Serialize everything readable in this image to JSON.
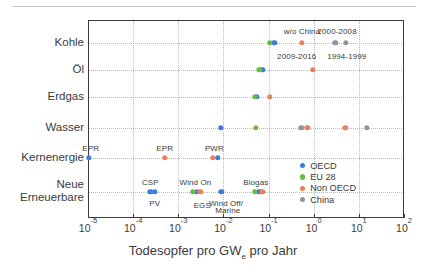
{
  "chart_data": {
    "type": "scatter",
    "title": "",
    "xlabel": "Todesopfer pro GWe pro Jahr",
    "xlabel_main": "Todesopfer pro GW",
    "xlabel_sub": "e",
    "xlabel_tail": " pro Jahr",
    "ylabel": "",
    "xscale": "log",
    "xlim": [
      1e-05,
      100.0
    ],
    "grid": "both-dotted",
    "legend_position": "inside-lower-right",
    "xticks": [
      {
        "value": 1e-05,
        "base": "10",
        "exp": "-5"
      },
      {
        "value": 0.0001,
        "base": "10",
        "exp": "-4"
      },
      {
        "value": 0.001,
        "base": "10",
        "exp": "-3"
      },
      {
        "value": 0.01,
        "base": "10",
        "exp": "-2"
      },
      {
        "value": 0.1,
        "base": "10",
        "exp": "-1"
      },
      {
        "value": 1.0,
        "base": "10",
        "exp": "0"
      },
      {
        "value": 10.0,
        "base": "10",
        "exp": "1"
      },
      {
        "value": 100.0,
        "base": "10",
        "exp": "2"
      }
    ],
    "categories": [
      {
        "id": "kohle",
        "label": "Kohle",
        "label2": ""
      },
      {
        "id": "oel",
        "label": "Öl",
        "label2": ""
      },
      {
        "id": "erdgas",
        "label": "Erdgas",
        "label2": ""
      },
      {
        "id": "wasser",
        "label": "Wasser",
        "label2": ""
      },
      {
        "id": "kernenergie",
        "label": "Kernenergie",
        "label2": ""
      },
      {
        "id": "renewables",
        "label": "Neue",
        "label2": "Erneuerbare"
      }
    ],
    "legend": [
      {
        "name": "OECD",
        "color": "#3b7dd8"
      },
      {
        "name": "EU 28",
        "color": "#67bd45"
      },
      {
        "name": "Non OECD",
        "color": "#e8825a"
      },
      {
        "name": "China",
        "color": "#8d949b"
      }
    ],
    "series": [
      {
        "name": "OECD",
        "color": "#3b7dd8",
        "points": [
          {
            "category": "kohle",
            "x": 0.135
          },
          {
            "category": "oel",
            "x": 0.072
          },
          {
            "category": "erdgas",
            "x": 0.055
          },
          {
            "category": "wasser",
            "x": 0.0088
          },
          {
            "category": "kernenergie",
            "x": 1.05e-05
          },
          {
            "category": "kernenergie",
            "x": 0.0075
          },
          {
            "category": "renewables",
            "x": 0.00024
          },
          {
            "category": "renewables",
            "x": 0.0003
          },
          {
            "category": "renewables",
            "x": 0.0026
          },
          {
            "category": "renewables",
            "x": 0.009
          },
          {
            "category": "renewables",
            "x": 0.062
          }
        ]
      },
      {
        "name": "EU 28",
        "color": "#67bd45",
        "points": [
          {
            "category": "kohle",
            "x": 0.105
          },
          {
            "category": "oel",
            "x": 0.062
          },
          {
            "category": "erdgas",
            "x": 0.05
          },
          {
            "category": "wasser",
            "x": 0.052
          },
          {
            "category": "renewables",
            "x": 0.0021
          },
          {
            "category": "renewables",
            "x": 0.05
          }
        ]
      },
      {
        "name": "Non OECD",
        "color": "#e8825a",
        "points": [
          {
            "category": "kohle",
            "x": 0.55
          },
          {
            "category": "oel",
            "x": 0.95
          },
          {
            "category": "erdgas",
            "x": 0.105
          },
          {
            "category": "wasser",
            "x": 0.72
          },
          {
            "category": "wasser",
            "x": 5.0
          },
          {
            "category": "kernenergie",
            "x": 0.0005
          },
          {
            "category": "kernenergie",
            "x": 0.0058
          },
          {
            "category": "renewables",
            "x": 0.0031
          },
          {
            "category": "renewables",
            "x": 0.073
          }
        ]
      },
      {
        "name": "China",
        "color": "#8d949b",
        "points": [
          {
            "category": "kohle",
            "x": 3.0
          },
          {
            "category": "kohle",
            "x": 5.2
          },
          {
            "category": "wasser",
            "x": 0.53
          },
          {
            "category": "wasser",
            "x": 15.0
          }
        ]
      }
    ],
    "annotations": [
      {
        "text": "w/o China",
        "category": "kohle",
        "x": 0.55,
        "dy": -12,
        "size": "big"
      },
      {
        "text": "2000-2008",
        "category": "kohle",
        "x": 3.3,
        "dy": -12,
        "size": "big"
      },
      {
        "text": "2009-2016",
        "category": "kohle",
        "x": 0.42,
        "dy": 13,
        "size": "big"
      },
      {
        "text": "1994-1999",
        "category": "kohle",
        "x": 5.4,
        "dy": 13,
        "size": "big"
      },
      {
        "text": "EPR",
        "category": "kernenergie",
        "x": 1.15e-05,
        "dy": -10,
        "size": "big"
      },
      {
        "text": "EPR",
        "category": "kernenergie",
        "x": 0.0005,
        "dy": -10,
        "size": "big"
      },
      {
        "text": "PWR",
        "category": "kernenergie",
        "x": 0.0063,
        "dy": -10,
        "size": "big"
      },
      {
        "text": "CSP",
        "category": "renewables",
        "x": 0.00024,
        "dy": -10,
        "size": "big"
      },
      {
        "text": "PV",
        "category": "renewables",
        "x": 0.0003,
        "dy": 11,
        "size": "big"
      },
      {
        "text": "Wind On",
        "category": "renewables",
        "x": 0.0024,
        "dy": -10,
        "size": "big"
      },
      {
        "text": "EGS",
        "category": "renewables",
        "x": 0.0034,
        "dy": 13,
        "size": "big"
      },
      {
        "text": "Wind Off/",
        "category": "renewables",
        "x": 0.0115,
        "dy": 11,
        "size": "big"
      },
      {
        "text": "Marine",
        "category": "renewables",
        "x": 0.0125,
        "dy": 18,
        "size": "big"
      },
      {
        "text": "Biogas",
        "category": "renewables",
        "x": 0.052,
        "dy": -10,
        "size": "big"
      }
    ]
  }
}
